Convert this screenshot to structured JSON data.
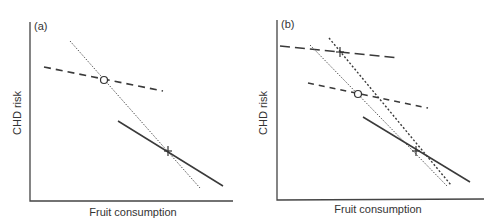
{
  "panels": [
    {
      "label": "(a)",
      "xlabel": "Fruit consumption",
      "ylabel": "CHD risk"
    },
    {
      "label": "(b)",
      "xlabel": "Fruit consumption",
      "ylabel": "CHD risk"
    }
  ],
  "colors": {
    "line": "#3a3a3a",
    "axis": "#444444",
    "background": "#ffffff"
  }
}
